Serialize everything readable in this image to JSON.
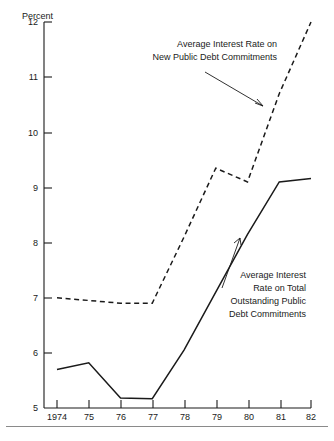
{
  "figure": {
    "y_axis_title": "Percent",
    "y_ticks": [
      "12",
      "11",
      "10",
      "9",
      "8",
      "7",
      "6",
      "5"
    ],
    "x_ticks": [
      "1974",
      "75",
      "76",
      "77",
      "78",
      "79",
      "80",
      "81",
      "82"
    ],
    "annotation_new": {
      "line1": "Average Interest Rate on",
      "line2": "New Public Debt Commitments"
    },
    "annotation_total": {
      "line1": "Average Interest",
      "line2": "Rate on Total",
      "line3": "Outstanding Public",
      "line4": "Debt Commitments"
    },
    "colors": {
      "ink": "#1a1a1a",
      "rule": "#8a8a8a",
      "background": "#ffffff"
    }
  },
  "chart_data": {
    "type": "line",
    "title": "",
    "subtitle": "",
    "xlabel": "",
    "ylabel": "Percent",
    "x": [
      1974,
      1975,
      1976,
      1977,
      1978,
      1979,
      1980,
      1981,
      1982
    ],
    "tick_labels_x": [
      "1974",
      "75",
      "76",
      "77",
      "78",
      "79",
      "80",
      "81",
      "82"
    ],
    "tick_labels_y": [
      "5",
      "6",
      "7",
      "8",
      "9",
      "10",
      "11",
      "12"
    ],
    "xlim": [
      1974,
      1982
    ],
    "ylim": [
      5,
      12
    ],
    "grid": false,
    "legend": "annotations-inline",
    "series": [
      {
        "name": "Average Interest Rate on New Public Debt Commitments",
        "style": "dashed",
        "values": [
          7.0,
          6.95,
          6.9,
          6.9,
          8.1,
          9.35,
          9.1,
          10.7,
          12.0
        ],
        "note": "1982 value extends beyond the top of the plot at 12 percent"
      },
      {
        "name": "Average Interest Rate on Total Outstanding Public Debt Commitments",
        "style": "solid",
        "values": [
          5.7,
          5.82,
          5.18,
          5.17,
          6.05,
          7.1,
          8.15,
          9.1,
          9.16
        ]
      }
    ],
    "annotations": [
      {
        "text": "Average Interest Rate on New Public Debt Commitments",
        "target_series": "Average Interest Rate on New Public Debt Commitments",
        "target_x": 1980.7,
        "target_y": 10.7
      },
      {
        "text": "Average Interest Rate on Total Outstanding Public Debt Commitments",
        "target_series": "Average Interest Rate on Total Outstanding Public Debt Commitments",
        "target_x": 1980.3,
        "target_y": 8.15
      }
    ]
  }
}
